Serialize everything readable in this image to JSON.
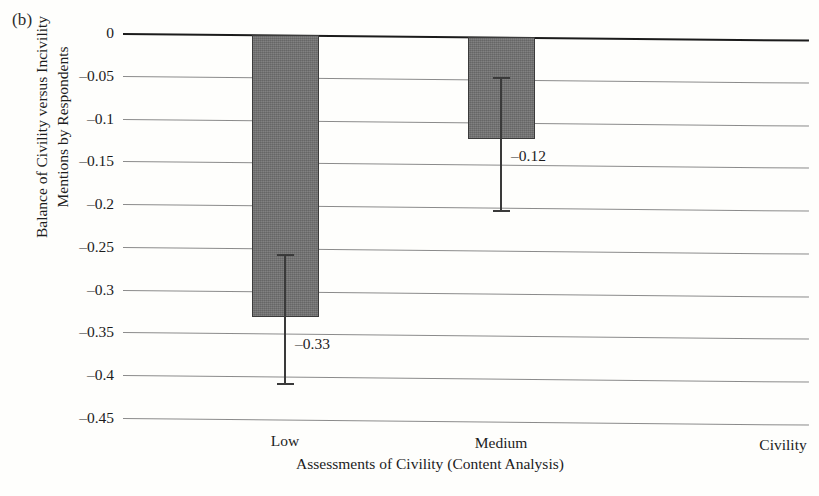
{
  "panel_label": "(b)",
  "chart_data": {
    "type": "bar",
    "title": "",
    "panel": "(b)",
    "categories": [
      "Low",
      "Medium",
      "Civility"
    ],
    "values": [
      -0.33,
      -0.12,
      null
    ],
    "data_labels": [
      "–0.33",
      "–0.12"
    ],
    "error_bars": [
      {
        "category": "Low",
        "low": -0.41,
        "high": -0.256
      },
      {
        "category": "Medium",
        "low": -0.205,
        "high": -0.047
      }
    ],
    "xlabel": "Assessments of Civility (Content Analysis)",
    "ylabel": "Balance of Civility versus Incivility Mentions by Respondents",
    "ylabel_lines": [
      "Balance of Civility versus Incivility",
      "Mentions by Respondents"
    ],
    "ylim": [
      -0.45,
      0
    ],
    "yticks": [
      0,
      -0.05,
      -0.1,
      -0.15,
      -0.2,
      -0.25,
      -0.3,
      -0.35,
      -0.4,
      -0.45
    ],
    "ytick_labels": [
      "0",
      "–0.05",
      "–0.1",
      "–0.15",
      "–0.2",
      "–0.25",
      "–0.3",
      "–0.35",
      "–0.4",
      "–0.45"
    ],
    "grid": true,
    "legend": false,
    "bar_color": "#6f6f6f",
    "bar_edge_color": "#3b3b3b",
    "gridline_color": "#8b8b8b",
    "zero_line_color": "#1b1b1b"
  }
}
